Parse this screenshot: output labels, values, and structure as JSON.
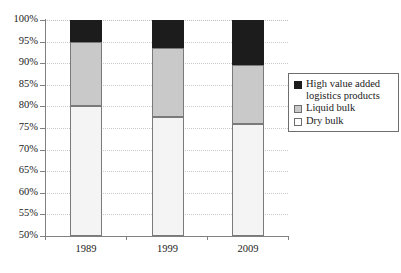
{
  "chart_data": {
    "type": "bar",
    "subtype": "stacked-100-percent",
    "title": "",
    "xlabel": "",
    "ylabel": "",
    "categories": [
      "1989",
      "1999",
      "2009"
    ],
    "ylim": [
      50,
      100
    ],
    "ytick_labels": [
      "100%",
      "95%",
      "90%",
      "85%",
      "80%",
      "75%",
      "70%",
      "65%",
      "60%",
      "55%",
      "50%"
    ],
    "ytick_values": [
      100,
      95,
      90,
      85,
      80,
      75,
      70,
      65,
      60,
      55,
      50
    ],
    "grid": true,
    "legend_position": "right",
    "series": [
      {
        "name": "High value added logistics products",
        "color": "#1c1c1c",
        "values": [
          5.0,
          6.5,
          10.5
        ]
      },
      {
        "name": "Liquid bulk",
        "color": "#c9c9c9",
        "values": [
          15.0,
          16.0,
          13.5
        ]
      },
      {
        "name": "Dry bulk",
        "color": "#f4f4f4",
        "values": [
          80.0,
          77.5,
          76.0
        ]
      }
    ],
    "stack_boundaries": {
      "1989": {
        "dry_top": 80.0,
        "liquid_top": 95.0,
        "high_top": 100.0
      },
      "1999": {
        "dry_top": 77.5,
        "liquid_top": 93.5,
        "high_top": 100.0
      },
      "2009": {
        "dry_top": 76.0,
        "liquid_top": 89.5,
        "high_top": 100.0
      }
    }
  },
  "legend": {
    "items": [
      {
        "label": "High value added logistics products",
        "swatch": "high"
      },
      {
        "label": "Liquid bulk",
        "swatch": "liquid"
      },
      {
        "label": "Dry bulk",
        "swatch": "dry"
      }
    ]
  }
}
